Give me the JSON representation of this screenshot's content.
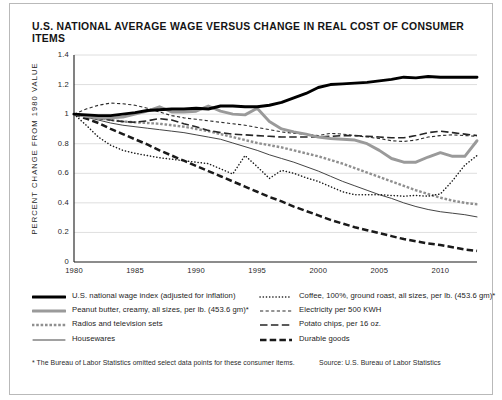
{
  "title": "U.S. NATIONAL AVERAGE WAGE VERSUS CHANGE IN REAL COST OF CONSUMER ITEMS",
  "footnote": "* The Bureau of Labor Statistics omitted select data points for these consumer items.",
  "source": "Source: U.S. Bureau of Labor Statistics",
  "legend": {
    "left": [
      {
        "label": "U.S. national wage index (adjusted for inflation)",
        "marker": "thick-solid-black",
        "color": "#000000"
      },
      {
        "label": "Peanut butter, creamy, all sizes, per lb. (453.6 gm)*",
        "marker": "thick-solid-gray",
        "color": "#9a9a9a"
      },
      {
        "label": "Radios and television sets",
        "marker": "square-dots-gray",
        "color": "#8f8f8f"
      },
      {
        "label": "Housewares",
        "marker": "thin-solid-black",
        "color": "#3a3a3a"
      }
    ],
    "right": [
      {
        "label": "Coffee, 100%, ground roast, all sizes, per lb. (453.6 gm)*",
        "marker": "fine-dots-black",
        "color": "#1a1a1a"
      },
      {
        "label": "Electricity per 500 KWH",
        "marker": "short-dash-black",
        "color": "#2b2b2b"
      },
      {
        "label": "Potato chips, per 16 oz.",
        "marker": "long-dash-black",
        "color": "#262626"
      },
      {
        "label": "Durable goods",
        "marker": "heavy-dash-black",
        "color": "#1a1a1a"
      }
    ]
  },
  "chart_data": {
    "type": "line",
    "title": "U.S. NATIONAL AVERAGE WAGE VERSUS CHANGE IN REAL COST OF CONSUMER ITEMS",
    "xlabel": "",
    "ylabel": "PERCENT CHANGE FROM 1980 VALUE",
    "xlim": [
      1980,
      2013
    ],
    "ylim": [
      0,
      1.4
    ],
    "yticks": [
      0,
      0.2,
      0.4,
      0.6,
      0.8,
      1,
      1.2,
      1.4
    ],
    "ytick_labels": [
      "0",
      "0.2",
      "0.4",
      "0.6",
      "0.8",
      "1",
      "1.2",
      "1.4"
    ],
    "xticks": [
      1980,
      1985,
      1990,
      1995,
      2000,
      2005,
      2010
    ],
    "xtick_labels": [
      "1980",
      "1985",
      "1990",
      "1995",
      "2000",
      "2005",
      "2010"
    ],
    "grid": "horizontal",
    "legend_position": "below-plot",
    "x": [
      1980,
      1981,
      1982,
      1983,
      1984,
      1985,
      1986,
      1987,
      1988,
      1989,
      1990,
      1991,
      1992,
      1993,
      1994,
      1995,
      1996,
      1997,
      1998,
      1999,
      2000,
      2001,
      2002,
      2003,
      2004,
      2005,
      2006,
      2007,
      2008,
      2009,
      2010,
      2011,
      2012,
      2013
    ],
    "series": [
      {
        "name": "U.S. national wage index (adjusted for inflation)",
        "style": "thick-solid",
        "color": "#000000",
        "values": [
          1.0,
          0.995,
          0.99,
          0.99,
          1.0,
          1.01,
          1.025,
          1.03,
          1.035,
          1.035,
          1.04,
          1.035,
          1.055,
          1.055,
          1.05,
          1.05,
          1.06,
          1.08,
          1.11,
          1.14,
          1.18,
          1.2,
          1.205,
          1.21,
          1.215,
          1.225,
          1.235,
          1.25,
          1.245,
          1.255,
          1.25,
          1.25,
          1.25,
          1.25
        ]
      },
      {
        "name": "Peanut butter, creamy, all sizes, per lb. (453.6 gm)*",
        "style": "thick-solid",
        "color": "#9a9a9a",
        "values": [
          1.0,
          0.985,
          0.975,
          0.975,
          0.98,
          1.0,
          1.02,
          1.05,
          1.015,
          1.015,
          1.02,
          1.055,
          1.02,
          1.0,
          0.995,
          1.04,
          0.95,
          0.9,
          0.88,
          0.865,
          0.845,
          0.835,
          0.83,
          0.825,
          0.8,
          0.755,
          0.7,
          0.675,
          0.675,
          0.71,
          0.74,
          0.715,
          0.715,
          0.82
        ]
      },
      {
        "name": "Radios and television sets",
        "style": "square-dots",
        "color": "#8f8f8f",
        "values": [
          1.0,
          0.985,
          0.975,
          0.96,
          0.95,
          0.945,
          0.94,
          0.935,
          0.925,
          0.915,
          0.9,
          0.885,
          0.865,
          0.845,
          0.825,
          0.805,
          0.79,
          0.775,
          0.755,
          0.735,
          0.715,
          0.69,
          0.665,
          0.635,
          0.605,
          0.575,
          0.545,
          0.515,
          0.485,
          0.46,
          0.435,
          0.415,
          0.4,
          0.39
        ]
      },
      {
        "name": "Housewares",
        "style": "thin-solid",
        "color": "#3a3a3a",
        "values": [
          1.0,
          0.98,
          0.96,
          0.94,
          0.925,
          0.915,
          0.905,
          0.895,
          0.885,
          0.875,
          0.86,
          0.845,
          0.83,
          0.805,
          0.78,
          0.755,
          0.725,
          0.7,
          0.675,
          0.645,
          0.615,
          0.58,
          0.545,
          0.515,
          0.485,
          0.455,
          0.43,
          0.4,
          0.375,
          0.355,
          0.34,
          0.33,
          0.32,
          0.305
        ]
      },
      {
        "name": "Coffee, 100%, ground roast, all sizes, per lb. (453.6 gm)*",
        "style": "fine-dots",
        "color": "#1a1a1a",
        "values": [
          1.0,
          0.925,
          0.845,
          0.79,
          0.755,
          0.735,
          0.72,
          0.705,
          0.695,
          0.685,
          0.675,
          0.665,
          0.63,
          0.595,
          0.72,
          0.645,
          0.565,
          0.62,
          0.6,
          0.57,
          0.545,
          0.51,
          0.475,
          0.455,
          0.455,
          0.455,
          0.45,
          0.445,
          0.45,
          0.445,
          0.46,
          0.55,
          0.655,
          0.72
        ]
      },
      {
        "name": "Electricity per 500 KWH",
        "style": "short-dash",
        "color": "#2b2b2b",
        "values": [
          1.0,
          1.035,
          1.06,
          1.075,
          1.07,
          1.06,
          1.04,
          1.015,
          0.99,
          0.975,
          0.965,
          0.955,
          0.945,
          0.935,
          0.925,
          0.91,
          0.895,
          0.88,
          0.87,
          0.865,
          0.855,
          0.87,
          0.865,
          0.855,
          0.845,
          0.835,
          0.82,
          0.815,
          0.825,
          0.845,
          0.855,
          0.86,
          0.855,
          0.85
        ]
      },
      {
        "name": "Potato chips, per 16 oz.",
        "style": "long-dash",
        "color": "#262626",
        "values": [
          1.0,
          0.985,
          0.97,
          0.96,
          0.95,
          0.945,
          0.955,
          0.97,
          0.96,
          0.935,
          0.915,
          0.89,
          0.875,
          0.865,
          0.86,
          0.855,
          0.85,
          0.845,
          0.845,
          0.845,
          0.845,
          0.85,
          0.855,
          0.855,
          0.85,
          0.845,
          0.84,
          0.84,
          0.855,
          0.875,
          0.885,
          0.875,
          0.865,
          0.855
        ]
      },
      {
        "name": "Durable goods",
        "style": "heavy-dash",
        "color": "#1a1a1a",
        "values": [
          1.0,
          0.97,
          0.94,
          0.9,
          0.865,
          0.83,
          0.795,
          0.755,
          0.72,
          0.685,
          0.65,
          0.615,
          0.58,
          0.545,
          0.51,
          0.475,
          0.44,
          0.41,
          0.375,
          0.345,
          0.315,
          0.285,
          0.26,
          0.235,
          0.215,
          0.195,
          0.175,
          0.155,
          0.14,
          0.125,
          0.115,
          0.1,
          0.085,
          0.075
        ]
      }
    ]
  }
}
